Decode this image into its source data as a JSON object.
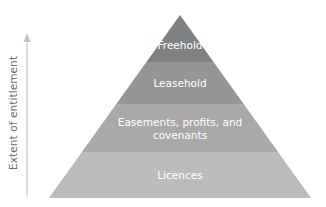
{
  "axis": {
    "label": "Extent of entitlement",
    "direction": "up",
    "color": "#c8c8c8"
  },
  "pyramid": {
    "layers": [
      {
        "label": "Freehold",
        "color": "#818181"
      },
      {
        "label": "Leasehold",
        "color": "#959595"
      },
      {
        "label": "Easements, profits, and",
        "label_line2": "covenants",
        "color": "#a9a9a9"
      },
      {
        "label": "Licences",
        "color": "#bbbbbb"
      }
    ]
  }
}
